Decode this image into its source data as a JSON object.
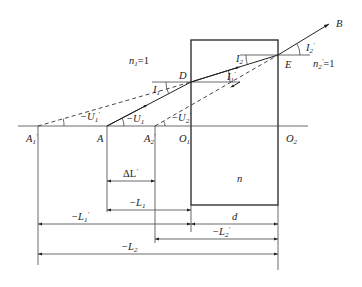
{
  "diagram": {
    "media": {
      "n1": {
        "label": "n",
        "sub": "1",
        "value": "=1"
      },
      "n": {
        "label": "n"
      },
      "n2prime": {
        "label": "n",
        "sub": "2",
        "prime": "′",
        "value": "=1"
      }
    },
    "points": {
      "A1p": {
        "label": "A",
        "sub": "1",
        "prime": "′"
      },
      "A": {
        "label": "A"
      },
      "A2p": {
        "label": "A",
        "sub": "2",
        "prime": "′"
      },
      "O1": {
        "label": "O",
        "sub": "1"
      },
      "O2": {
        "label": "O",
        "sub": "2"
      },
      "D": {
        "label": "D"
      },
      "E": {
        "label": "E"
      },
      "B": {
        "label": "B"
      }
    },
    "angles": {
      "U1": {
        "label": "−U",
        "sub": "1"
      },
      "U1p": {
        "label": "−U",
        "sub": "1",
        "prime": "′"
      },
      "U2p": {
        "label": "−U",
        "sub": "2",
        "prime": "′"
      },
      "I1": {
        "label": "I",
        "sub": "1"
      },
      "I1p": {
        "label": "I",
        "sub": "1",
        "prime": "′"
      },
      "I2": {
        "label": "I",
        "sub": "2"
      },
      "I2p": {
        "label": "I",
        "sub": "2",
        "prime": "′"
      }
    },
    "dimensions": {
      "dL": {
        "label": "ΔL",
        "prime": "′"
      },
      "L1": {
        "label": "−L",
        "sub": "1"
      },
      "L1p": {
        "label": "−L",
        "sub": "1",
        "prime": "′"
      },
      "d": {
        "label": "d"
      },
      "L2p": {
        "label": "−L",
        "sub": "2",
        "prime": "′"
      },
      "L2": {
        "label": "−L",
        "sub": "2"
      }
    }
  }
}
